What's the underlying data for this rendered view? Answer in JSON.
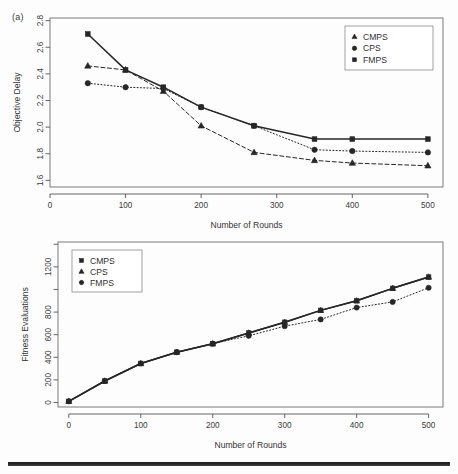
{
  "figure": {
    "panel_a_tag": "(a)",
    "axis_titles": {
      "x": "Number of Rounds",
      "y_top": "Objective Delay",
      "y_bottom": "Fitness Evaluations"
    }
  },
  "chart_data": [
    {
      "id": "panel-a",
      "type": "line",
      "title": "(a)",
      "xlabel": "Number of Rounds",
      "ylabel": "Objective Delay",
      "xlim": [
        0,
        520
      ],
      "ylim": [
        1.55,
        2.82
      ],
      "xticks": [
        0,
        100,
        200,
        300,
        400,
        500
      ],
      "xtick_labels": [
        "0",
        "100",
        "200",
        "300",
        "400",
        "500"
      ],
      "yticks": [
        1.6,
        1.8,
        2.0,
        2.2,
        2.4,
        2.6,
        2.8
      ],
      "ytick_labels": [
        "1.6",
        "1.8",
        "2.0",
        "2.2",
        "2.4",
        "2.6",
        "2.8"
      ],
      "grid": false,
      "legend_position": "top-right",
      "series": [
        {
          "name": "CMPS",
          "marker": "triangle",
          "line": "dashed",
          "x": [
            50,
            100,
            150,
            200,
            270,
            350,
            400,
            500
          ],
          "values": [
            2.46,
            2.43,
            2.27,
            2.01,
            1.81,
            1.75,
            1.73,
            1.71
          ]
        },
        {
          "name": "CPS",
          "marker": "circle",
          "line": "dotted",
          "x": [
            50,
            100,
            150,
            200,
            270,
            350,
            400,
            500
          ],
          "values": [
            2.33,
            2.3,
            2.29,
            2.15,
            2.01,
            1.83,
            1.82,
            1.81
          ]
        },
        {
          "name": "FMPS",
          "marker": "square",
          "line": "solid",
          "x": [
            50,
            100,
            150,
            200,
            270,
            350,
            400,
            500
          ],
          "values": [
            2.7,
            2.43,
            2.3,
            2.15,
            2.01,
            1.91,
            1.91,
            1.91
          ]
        }
      ]
    },
    {
      "id": "panel-b",
      "type": "line",
      "title": "",
      "xlabel": "Number of Rounds",
      "ylabel": "Fitness Evaluations",
      "xlim": [
        -15,
        520
      ],
      "ylim": [
        -40,
        1420
      ],
      "xticks": [
        0,
        100,
        200,
        300,
        400,
        500
      ],
      "xtick_labels": [
        "0",
        "100",
        "200",
        "300",
        "400",
        "500"
      ],
      "yticks": [
        0,
        200,
        400,
        600,
        800,
        1000,
        1200,
        1400
      ],
      "ytick_labels": [
        "0",
        "200",
        "400",
        "600",
        "800",
        "",
        "1200",
        ""
      ],
      "grid": false,
      "legend_position": "top-left",
      "series": [
        {
          "name": "CMPS",
          "marker": "square",
          "line": "solid",
          "x": [
            0,
            50,
            100,
            150,
            200,
            250,
            300,
            350,
            400,
            450,
            500
          ],
          "values": [
            10,
            190,
            345,
            445,
            520,
            615,
            710,
            815,
            900,
            1010,
            1110
          ]
        },
        {
          "name": "CPS",
          "marker": "triangle",
          "line": "solid",
          "x": [
            0,
            50,
            100,
            150,
            200,
            250,
            300,
            350,
            400,
            450,
            500
          ],
          "values": [
            10,
            190,
            345,
            445,
            520,
            615,
            710,
            815,
            900,
            1010,
            1110
          ]
        },
        {
          "name": "FMPS",
          "marker": "circle",
          "line": "dotted",
          "x": [
            0,
            50,
            100,
            150,
            200,
            250,
            300,
            350,
            400,
            450,
            500
          ],
          "values": [
            10,
            190,
            345,
            445,
            520,
            590,
            675,
            735,
            840,
            890,
            1015
          ]
        }
      ]
    }
  ],
  "legends": {
    "panel_a": [
      {
        "label": "CMPS",
        "marker": "triangle"
      },
      {
        "label": "CPS",
        "marker": "circle"
      },
      {
        "label": "FMPS",
        "marker": "square"
      }
    ],
    "panel_b": [
      {
        "label": "CMPS",
        "marker": "square"
      },
      {
        "label": "CPS",
        "marker": "triangle"
      },
      {
        "label": "FMPS",
        "marker": "circle"
      }
    ]
  },
  "colors": {
    "ink": "#2f2f2f",
    "axis": "#555555",
    "frame": "#6d6d6d",
    "background": "#fdfdfd"
  }
}
